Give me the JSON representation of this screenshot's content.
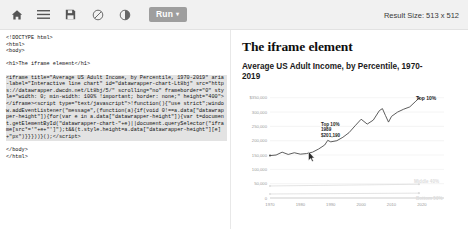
{
  "toolbar": {
    "icons": [
      {
        "name": "home-icon",
        "label": "Home"
      },
      {
        "name": "menu-icon",
        "label": "Menu"
      },
      {
        "name": "save-icon",
        "label": "Save"
      },
      {
        "name": "no-entry-icon",
        "label": "Disable"
      },
      {
        "name": "contrast-icon",
        "label": "Dark mode"
      }
    ],
    "run_label": "Run",
    "run_caret": "▾",
    "result_size_label": "Result Size: 513 x 512"
  },
  "editor": {
    "lines": [
      "<!DOCTYPE html>",
      "<html>",
      "<body>",
      "",
      "<h1>The iframe element</h1>",
      "",
      "<iframe title=\"Average US Adult Income, by Percentile, 1970-2019\" aria-label=\"Interactive line chart\" id=\"datawrapper-chart-Lt8bj\" src=\"https://datawrapper.dwcdn.net/Lt8bj/5/\" scrolling=\"no\" frameborder=\"0\" style=\"width: 0; min-width: 100% !important; border: none;\" height=\"400\"></iframe><script type=\"text/javascript\">!function(){\"use strict\";window.addEventListener(\"message\",(function(a){if(void 0!==a.data[\"datawrapper-height\"]){for(var e in a.data[\"datawrapper-height\"]){var t=document.getElementById(\"datawrapper-chart-\"+e)||document.querySelector(\"iframe[src*='\"+e+\"']\");t&&(t.style.height=a.data[\"datawrapper-height\"][e]+\"px\")}}}))}();</script>",
      "",
      "</body>",
      "</html>"
    ],
    "highlighted_from": 6,
    "highlighted_to": 6
  },
  "result": {
    "heading": "The iframe element"
  },
  "chart_data": {
    "type": "line",
    "title": "Average US Adult Income, by Percentile, 1970-2019",
    "xlabel": "",
    "ylabel": "",
    "xlim": [
      1970,
      2022
    ],
    "ylim": [
      0,
      370000
    ],
    "grid": true,
    "legend_position": "line-end-labels",
    "x_ticks": [
      "1970",
      "1980",
      "1990",
      "2000",
      "2010",
      "2020"
    ],
    "x_tick_values": [
      1970,
      1980,
      1990,
      2000,
      2010,
      2020
    ],
    "y_ticks": [
      "350,000",
      "300,000",
      "250,000",
      "200,000",
      "150,000",
      "100,000",
      "50,000",
      "0"
    ],
    "y_tick_values": [
      350000,
      300000,
      250000,
      200000,
      150000,
      100000,
      50000,
      0
    ],
    "y_first_tick_prefix": "$",
    "annotations": [
      {
        "name": "tooltip",
        "lines": [
          "Top 10%",
          "1989",
          "$201,190"
        ],
        "x": 1989,
        "y": 201190
      },
      {
        "name": "series-end-label",
        "text": "Top 10%",
        "x": 2019,
        "y": 349000
      }
    ],
    "series": [
      {
        "name": "Top 10%",
        "color": "#4b4b4b",
        "end_label": "Top 10%",
        "x": [
          1970,
          1972,
          1974,
          1976,
          1978,
          1980,
          1982,
          1984,
          1986,
          1988,
          1989,
          1990,
          1992,
          1994,
          1996,
          1998,
          2000,
          2002,
          2004,
          2006,
          2007,
          2008,
          2009,
          2010,
          2012,
          2014,
          2016,
          2018,
          2019
        ],
        "values": [
          148000,
          150000,
          160000,
          152000,
          158000,
          153000,
          155000,
          160000,
          171000,
          185000,
          201190,
          196000,
          200000,
          212000,
          228000,
          252000,
          275000,
          258000,
          272000,
          305000,
          312000,
          288000,
          265000,
          285000,
          300000,
          310000,
          318000,
          338000,
          348000
        ]
      },
      {
        "name": "Middle 40%",
        "color": "#dcdcdc",
        "end_label": "Middle 40%",
        "x": [
          1970,
          2019
        ],
        "values": [
          42000,
          48000
        ]
      },
      {
        "name": "Bottom 50%",
        "color": "#dcdcdc",
        "end_label": "Bottom 50%",
        "x": [
          1970,
          2019
        ],
        "values": [
          14000,
          17000
        ]
      }
    ]
  }
}
